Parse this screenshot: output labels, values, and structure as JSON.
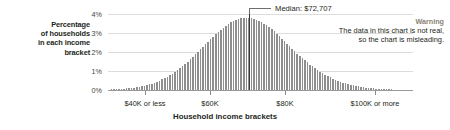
{
  "chart_data": {
    "type": "bar",
    "title": "",
    "xlabel": "Household income brackets",
    "ylabel": "Percentage of households in each income bracket",
    "ylim": [
      0,
      4
    ],
    "grid": true,
    "y_tick_labels": [
      "0%",
      "1%",
      "2%",
      "3%",
      "4%"
    ],
    "y_tick_values": [
      0,
      1,
      2,
      3,
      4
    ],
    "x_tick_labels": [
      "$40K or less",
      "$60K",
      "$80K",
      "$100K or more"
    ],
    "x_tick_positions": [
      145,
      210,
      285,
      375
    ],
    "annotations": [
      {
        "name": "median",
        "label": "Median: $72,707",
        "value": 72707
      }
    ],
    "warning": {
      "title": "Warning",
      "line1": "The data in this chart is not real,",
      "line2": "so the chart is misleading."
    },
    "bar_color": "#8e8e8e",
    "median_line_color": "#3a3a3a",
    "warning_color": "#8a8272",
    "values": [
      0.02,
      0.03,
      0.03,
      0.04,
      0.05,
      0.06,
      0.07,
      0.08,
      0.1,
      0.11,
      0.13,
      0.15,
      0.17,
      0.2,
      0.23,
      0.26,
      0.3,
      0.34,
      0.39,
      0.44,
      0.5,
      0.56,
      0.63,
      0.7,
      0.78,
      0.86,
      0.95,
      1.05,
      1.15,
      1.26,
      1.37,
      1.49,
      1.61,
      1.74,
      1.87,
      2.0,
      2.14,
      2.27,
      2.41,
      2.55,
      2.68,
      2.81,
      2.94,
      3.06,
      3.18,
      3.29,
      3.39,
      3.48,
      3.56,
      3.63,
      3.69,
      3.74,
      3.77,
      3.79,
      3.8,
      3.79,
      3.77,
      3.74,
      3.7,
      3.64,
      3.57,
      3.49,
      3.4,
      3.3,
      3.19,
      3.08,
      2.96,
      2.83,
      2.7,
      2.57,
      2.44,
      2.31,
      2.18,
      2.05,
      1.92,
      1.8,
      1.68,
      1.56,
      1.45,
      1.34,
      1.24,
      1.14,
      1.05,
      0.96,
      0.88,
      0.8,
      0.73,
      0.66,
      0.6,
      0.54,
      0.49,
      0.44,
      0.39,
      0.35,
      0.31,
      0.28,
      0.25,
      0.22,
      0.19,
      0.17,
      0.15,
      0.13,
      0.11,
      0.1,
      0.09,
      0.07,
      0.06,
      0.05,
      0.05,
      0.04,
      0.03,
      0.03,
      0.02,
      0.02,
      0.02,
      0.01,
      0.01,
      0.01,
      0.01,
      0.01
    ],
    "median_bar_index": 55
  },
  "y_axis_caption": {
    "line1": "Percentage",
    "line2": "of households",
    "line3": "in each income",
    "line4": "bracket"
  }
}
